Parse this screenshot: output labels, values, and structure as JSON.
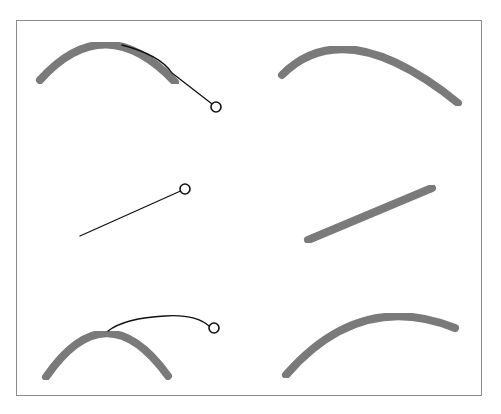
{
  "figure": {
    "colors": {
      "background": "#ffffff",
      "frame": "#8a8a8a",
      "curve": "#7a7a7a",
      "handle_line": "#111111",
      "handle_circle": "#111111"
    },
    "stroke_widths": {
      "curve": 8,
      "handle_line": 1.3,
      "handle_circle": 1.6
    },
    "handle_radius": 5,
    "rows": [
      {
        "name": "arc-drag",
        "before": {
          "curve_path": "M40,80 Q105,8 175,82",
          "handle_path": "M122,45 Q160,55 172,73 L216,107",
          "handle_point": [
            216,
            107
          ]
        },
        "after": {
          "curve_path": "M282,75 Q345,12 458,103"
        }
      },
      {
        "name": "line-rotate",
        "before": {
          "curve_path": "M63,238 L197,238",
          "handle_path": "M80,236 L185,189",
          "handle_point": [
            185,
            189
          ]
        },
        "after": {
          "curve_path": "M308,240 L432,188"
        }
      },
      {
        "name": "arc-extend",
        "before": {
          "curve_path": "M46,377 Q106,290 168,376",
          "handle_path": "M108,331 Q125,318 165,316 Q195,314 209,326",
          "handle_point": [
            214,
            328
          ]
        },
        "after": {
          "curve_path": "M286,375 Q360,290 455,328"
        }
      }
    ]
  }
}
